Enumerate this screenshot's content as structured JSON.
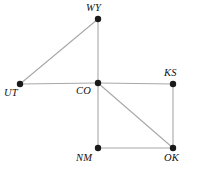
{
  "figure": {
    "width": 200,
    "height": 177,
    "background_color": "#ffffff",
    "edge_color": "#a8a8a8",
    "node_color": "#1a1a1a",
    "label_color": "#111111",
    "node_radius": 3.2,
    "edge_width": 1.1
  },
  "chart_data": {
    "type": "diagram",
    "title": "",
    "nodes": [
      {
        "id": "WY",
        "label": "WY",
        "x": 98,
        "y": 19,
        "label_x": 86,
        "label_y": 3,
        "label_position": "above-left"
      },
      {
        "id": "UT",
        "label": "UT",
        "x": 20,
        "y": 84,
        "label_x": 4,
        "label_y": 88,
        "label_position": "below-left"
      },
      {
        "id": "CO",
        "label": "CO",
        "x": 98,
        "y": 83,
        "label_x": 76,
        "label_y": 86,
        "label_position": "below-left"
      },
      {
        "id": "KS",
        "label": "KS",
        "x": 173,
        "y": 84,
        "label_x": 164,
        "label_y": 68,
        "label_position": "above"
      },
      {
        "id": "NM",
        "label": "NM",
        "x": 98,
        "y": 148,
        "label_x": 76,
        "label_y": 153,
        "label_position": "below-left"
      },
      {
        "id": "OK",
        "label": "OK",
        "x": 173,
        "y": 148,
        "label_x": 164,
        "label_y": 153,
        "label_position": "below"
      }
    ],
    "edges": [
      {
        "from": "UT",
        "to": "WY"
      },
      {
        "from": "UT",
        "to": "CO"
      },
      {
        "from": "WY",
        "to": "CO"
      },
      {
        "from": "CO",
        "to": "KS"
      },
      {
        "from": "CO",
        "to": "NM"
      },
      {
        "from": "CO",
        "to": "OK"
      },
      {
        "from": "NM",
        "to": "OK"
      },
      {
        "from": "KS",
        "to": "OK"
      }
    ],
    "node_count": 6,
    "edge_count": 8
  }
}
